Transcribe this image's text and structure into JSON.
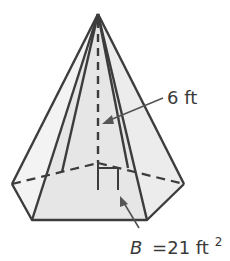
{
  "figure": {
    "type": "hexagonal pyramid",
    "height_label": "6 ft",
    "base_label": {
      "variable": "B",
      "equals": "=21 ft",
      "exponent": "2"
    }
  },
  "colors": {
    "stroke": "#3c3c3c",
    "face_fill": "#e8e8e8",
    "side_fill": "#f1f1f1",
    "text": "#3a3a3a"
  }
}
